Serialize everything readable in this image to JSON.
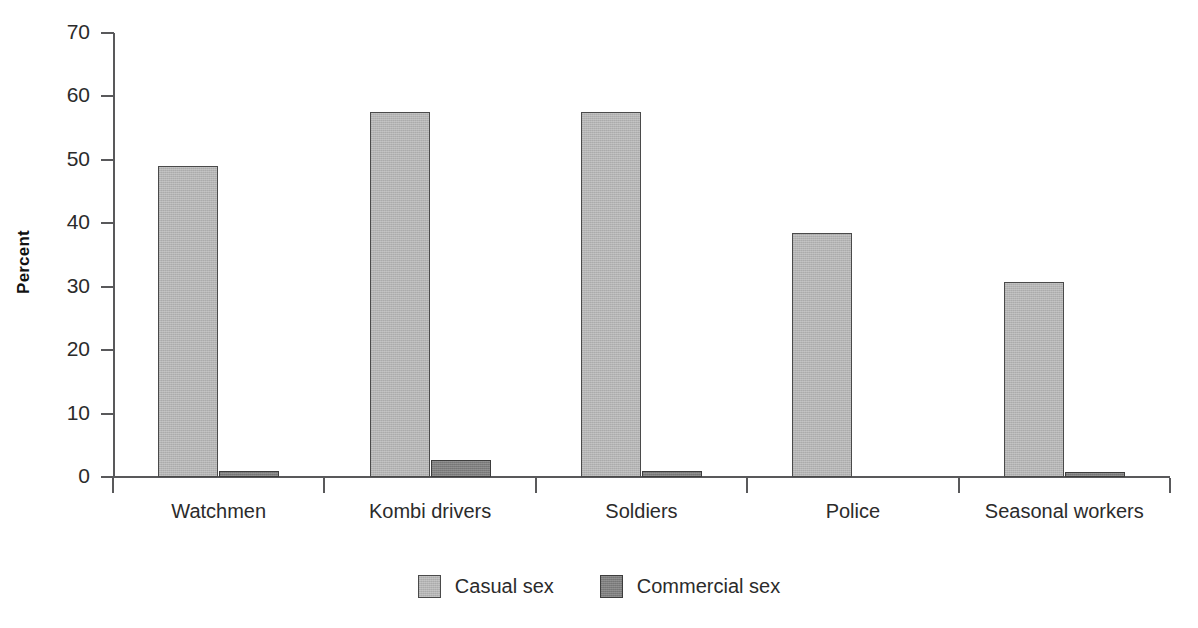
{
  "chart_data": {
    "type": "bar",
    "title": "",
    "subtitle": "",
    "xlabel": "",
    "ylabel": "Percent",
    "ylim": [
      0,
      70
    ],
    "yticks": [
      0,
      10,
      20,
      30,
      40,
      50,
      60,
      70
    ],
    "ytick_labels": [
      "0",
      "10",
      "20",
      "30",
      "40",
      "50",
      "60",
      "70"
    ],
    "grid": false,
    "legend_position": "bottom-center",
    "categories": [
      "Watchmen",
      "Kombi drivers",
      "Soldiers",
      "Police",
      "Seasonal workers"
    ],
    "series": [
      {
        "name": "Casual sex",
        "color": "#b4b4b4",
        "edge_color": "#4a4a4a",
        "values": [
          49.0,
          57.6,
          57.6,
          38.4,
          30.8
        ]
      },
      {
        "name": "Commercial sex",
        "color": "#7d7d7d",
        "edge_color": "#3d3d3d",
        "values": [
          1.0,
          2.7,
          1.0,
          0.0,
          0.5
        ]
      }
    ],
    "annotations": []
  },
  "colors": {
    "background": "#ffffff",
    "axis": "#59595b",
    "text": "#2b2b2b",
    "casual": "#b4b4b4",
    "commercial": "#7d7d7d"
  },
  "legend": {
    "items": [
      {
        "label": "Casual sex",
        "swatch": "casual"
      },
      {
        "label": "Commercial sex",
        "swatch": "commercial"
      }
    ]
  }
}
